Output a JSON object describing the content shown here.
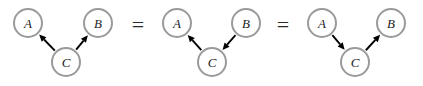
{
  "figure": {
    "background_color": "#ffffff",
    "node_fill_color": "#ffffff",
    "node_stroke_color": "#9a9a9a",
    "label_color": "#1c1c1c",
    "edge_color": "#000000",
    "separator_color": "#2a2a2a"
  },
  "separators": [
    {
      "symbol": "=",
      "x": 138,
      "y": 24
    },
    {
      "symbol": "=",
      "x": 283,
      "y": 24
    }
  ],
  "graphs": [
    {
      "id": "graph-1",
      "structure": "fork",
      "nodes": [
        {
          "id": "A",
          "label": "A",
          "x": 28,
          "y": 23,
          "r": 14
        },
        {
          "id": "B",
          "label": "B",
          "x": 98,
          "y": 23,
          "r": 14
        },
        {
          "id": "C",
          "label": "C",
          "x": 66,
          "y": 62,
          "r": 14
        }
      ],
      "edges": [
        {
          "from": "C",
          "to": "A",
          "directed": true
        },
        {
          "from": "C",
          "to": "B",
          "directed": true
        }
      ]
    },
    {
      "id": "graph-2",
      "structure": "chain-b-to-a",
      "nodes": [
        {
          "id": "A",
          "label": "A",
          "x": 177,
          "y": 23,
          "r": 14
        },
        {
          "id": "B",
          "label": "B",
          "x": 246,
          "y": 23,
          "r": 14
        },
        {
          "id": "C",
          "label": "C",
          "x": 212,
          "y": 62,
          "r": 14
        }
      ],
      "edges": [
        {
          "from": "B",
          "to": "C",
          "directed": true
        },
        {
          "from": "C",
          "to": "A",
          "directed": true
        }
      ]
    },
    {
      "id": "graph-3",
      "structure": "chain-a-to-b",
      "nodes": [
        {
          "id": "A",
          "label": "A",
          "x": 322,
          "y": 23,
          "r": 14
        },
        {
          "id": "B",
          "label": "B",
          "x": 391,
          "y": 23,
          "r": 14
        },
        {
          "id": "C",
          "label": "C",
          "x": 355,
          "y": 62,
          "r": 14
        }
      ],
      "edges": [
        {
          "from": "A",
          "to": "C",
          "directed": true
        },
        {
          "from": "C",
          "to": "B",
          "directed": true
        }
      ]
    }
  ]
}
